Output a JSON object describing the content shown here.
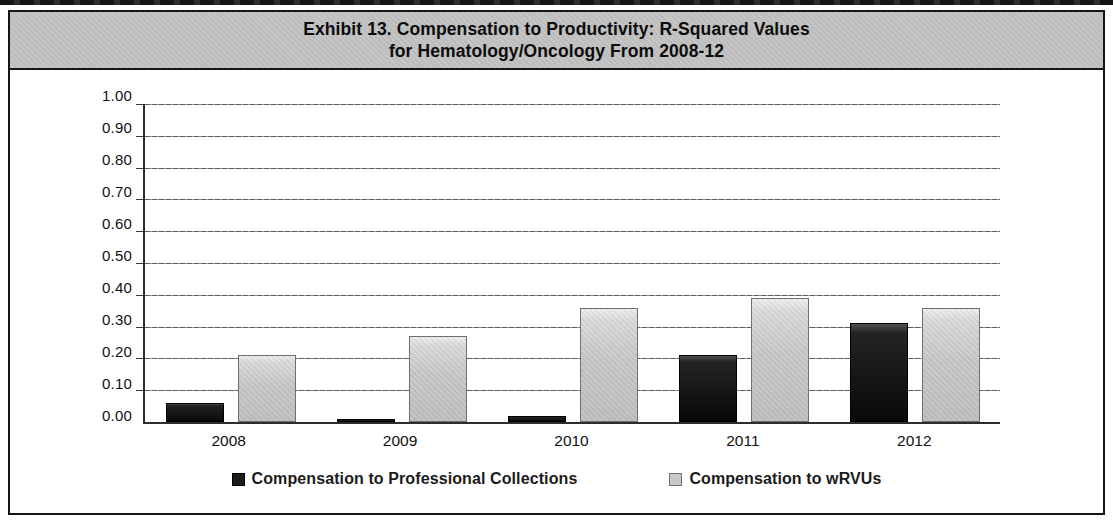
{
  "figure": {
    "title_line1": "Exhibit 13. Compensation to Productivity: R-Squared Values",
    "title_line2": "for Hematology/Oncology From 2008-12",
    "banner_bg": "#c3c3c3",
    "border_color": "#151515"
  },
  "chart_data": {
    "type": "bar",
    "title": "Exhibit 13. Compensation to Productivity: R-Squared Values for Hematology/Oncology From 2008-12",
    "categories": [
      "2008",
      "2009",
      "2010",
      "2011",
      "2012"
    ],
    "series": [
      {
        "key": "collections",
        "name": "Compensation to Professional Collections",
        "color": "#1c1c1c",
        "values": [
          0.06,
          0.01,
          0.02,
          0.21,
          0.31
        ]
      },
      {
        "key": "wrvus",
        "name": "Compensation to wRVUs",
        "color": "#c8c8c8",
        "values": [
          0.21,
          0.27,
          0.36,
          0.39,
          0.36
        ]
      }
    ],
    "xlabel": "",
    "ylabel": "",
    "ylim": [
      0.0,
      1.0
    ],
    "ytick_step": 0.1,
    "ytick_labels": [
      "0.00",
      "0.10",
      "0.20",
      "0.30",
      "0.40",
      "0.50",
      "0.60",
      "0.70",
      "0.80",
      "0.90",
      "1.00"
    ],
    "grid": true,
    "gridline_color": "#6a6a6a",
    "legend_position": "bottom"
  }
}
